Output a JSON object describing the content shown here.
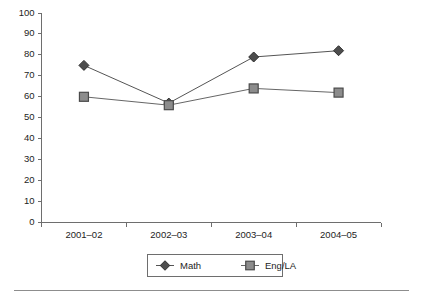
{
  "chart_data": {
    "type": "line",
    "title": "",
    "subtitle": "",
    "xlabel": "",
    "ylabel": "",
    "categories": [
      "2001–02",
      "2002–03",
      "2003–04",
      "2004–05"
    ],
    "series": [
      {
        "name": "Math",
        "values": [
          75,
          57,
          79,
          82
        ],
        "marker": "diamond",
        "color": "#4d4d4d",
        "line_color": "#555555"
      },
      {
        "name": "Eng/LA",
        "values": [
          60,
          56,
          64,
          62
        ],
        "marker": "square",
        "color": "#8c8c8c",
        "line_color": "#666666"
      }
    ],
    "ylim": [
      0,
      100
    ],
    "ytick_values": [
      0,
      10,
      20,
      30,
      40,
      50,
      60,
      70,
      80,
      90,
      100
    ],
    "ytick_labels": [
      "0",
      "10",
      "20",
      "30",
      "40",
      "50",
      "60",
      "70",
      "80",
      "90",
      "100"
    ],
    "grid": false,
    "legend_position": "bottom",
    "legend_entries": [
      "Math",
      "Eng/LA"
    ]
  },
  "legend": {
    "items": [
      {
        "label": "Math",
        "marker": "diamond-marker"
      },
      {
        "label": "Eng/LA",
        "marker": "square-marker"
      }
    ]
  },
  "axes": {
    "y_axis_name": "y-axis",
    "x_axis_name": "x-axis"
  },
  "footer": {
    "rule_name": "horizontal-divider-rule"
  }
}
